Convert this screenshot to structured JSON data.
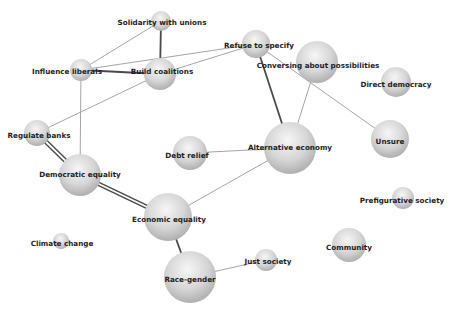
{
  "diagram": {
    "type": "network-graph",
    "nodes": [
      {
        "id": "solidarity",
        "label": "Solidarity with unions",
        "x": 161,
        "y": 21,
        "r": 10,
        "lx": 162,
        "ly": 23
      },
      {
        "id": "influence",
        "label": "Influence liberals",
        "x": 81,
        "y": 70,
        "r": 11,
        "lx": 67,
        "ly": 72
      },
      {
        "id": "build",
        "label": "Build coalitions",
        "x": 160,
        "y": 74,
        "r": 16,
        "lx": 162,
        "ly": 72
      },
      {
        "id": "refuse",
        "label": "Refuse to specify",
        "x": 256,
        "y": 44,
        "r": 14,
        "lx": 259,
        "ly": 46
      },
      {
        "id": "conversing",
        "label": "Conversing about possibilities",
        "x": 317,
        "y": 62,
        "r": 21,
        "lx": 318,
        "ly": 66
      },
      {
        "id": "direct",
        "label": "Direct democracy",
        "x": 396,
        "y": 82,
        "r": 15,
        "lx": 396,
        "ly": 85
      },
      {
        "id": "regulate",
        "label": "Regulate banks",
        "x": 37,
        "y": 133,
        "r": 13,
        "lx": 39,
        "ly": 136
      },
      {
        "id": "debt",
        "label": "Debt relief",
        "x": 190,
        "y": 153,
        "r": 17,
        "lx": 187,
        "ly": 156
      },
      {
        "id": "alternative",
        "label": "Alternative economy",
        "x": 290,
        "y": 148,
        "r": 26,
        "lx": 290,
        "ly": 148
      },
      {
        "id": "unsure",
        "label": "Unsure",
        "x": 390,
        "y": 139,
        "r": 19,
        "lx": 390,
        "ly": 142
      },
      {
        "id": "democratic",
        "label": "Democratic equality",
        "x": 80,
        "y": 175,
        "r": 21,
        "lx": 80,
        "ly": 175
      },
      {
        "id": "economic",
        "label": "Economic equality",
        "x": 168,
        "y": 217,
        "r": 24,
        "lx": 169,
        "ly": 220
      },
      {
        "id": "prefigurative",
        "label": "Prefigurative society",
        "x": 403,
        "y": 198,
        "r": 11,
        "lx": 402,
        "ly": 201
      },
      {
        "id": "climate",
        "label": "Climate change",
        "x": 61,
        "y": 241,
        "r": 8,
        "lx": 62,
        "ly": 244
      },
      {
        "id": "community",
        "label": "Community",
        "x": 349,
        "y": 245,
        "r": 17,
        "lx": 349,
        "ly": 248
      },
      {
        "id": "just",
        "label": "Just society",
        "x": 266,
        "y": 260,
        "r": 11,
        "lx": 268,
        "ly": 262
      },
      {
        "id": "race",
        "label": "Race-gender",
        "x": 190,
        "y": 277,
        "r": 26,
        "lx": 190,
        "ly": 280
      }
    ],
    "edges": [
      {
        "from": "solidarity",
        "to": "influence",
        "weight": 1
      },
      {
        "from": "solidarity",
        "to": "build",
        "weight": 2
      },
      {
        "from": "influence",
        "to": "build",
        "weight": 2
      },
      {
        "from": "influence",
        "to": "refuse",
        "weight": 1
      },
      {
        "from": "build",
        "to": "refuse",
        "weight": 1
      },
      {
        "from": "influence",
        "to": "democratic",
        "weight": 1
      },
      {
        "from": "build",
        "to": "regulate",
        "weight": 1
      },
      {
        "from": "refuse",
        "to": "alternative",
        "weight": 2
      },
      {
        "from": "refuse",
        "to": "unsure",
        "weight": 1
      },
      {
        "from": "conversing",
        "to": "alternative",
        "weight": 1
      },
      {
        "from": "regulate",
        "to": "democratic",
        "weight": 3
      },
      {
        "from": "democratic",
        "to": "economic",
        "weight": 3
      },
      {
        "from": "debt",
        "to": "alternative",
        "weight": 1
      },
      {
        "from": "alternative",
        "to": "economic",
        "weight": 1
      },
      {
        "from": "economic",
        "to": "race",
        "weight": 2
      },
      {
        "from": "race",
        "to": "just",
        "weight": 1
      }
    ],
    "colors": {
      "background": "#ffffff",
      "node_light": "#f4f4f4",
      "node_dark": "#a9a9a9",
      "edge_thin": "#9a9a9a",
      "edge_thick": "#4a4a4a",
      "label": "#1e1e1e"
    }
  }
}
